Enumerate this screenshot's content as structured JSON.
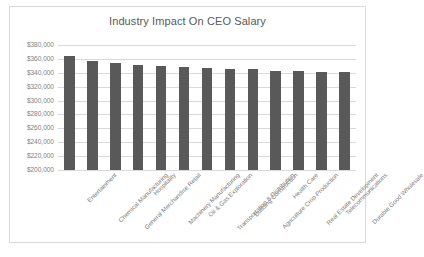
{
  "chart_data": {
    "type": "bar",
    "title": "Industry Impact On CEO Salary",
    "xlabel": "",
    "ylabel": "",
    "ylim": [
      200000,
      380000
    ],
    "ytick_step": 20000,
    "grid": true,
    "legend": false,
    "bar_color": "#595959",
    "gridline_color": "#d9d9d9",
    "ytick_labels": [
      "$380,000",
      "$360,000",
      "$340,000",
      "$320,000",
      "$300,000",
      "$280,000",
      "$260,000",
      "$240,000",
      "$220,000",
      "$200,000"
    ],
    "ytick_values": [
      380000,
      360000,
      340000,
      320000,
      300000,
      280000,
      260000,
      240000,
      220000,
      200000
    ],
    "categories": [
      "Entertainment",
      "Chemical Manufacturing",
      "General Merchandise Retail",
      "Hospitality",
      "Machinery Manufacturing",
      "Oil & Gas Exploration",
      "Transportation & Distribution",
      "Building Construction",
      "Agriculture Crop Production",
      "Health Care",
      "Real Estate Development",
      "Telecommunications",
      "Durable Good Wholesale"
    ],
    "values": [
      364000,
      357000,
      354000,
      351000,
      350000,
      348000,
      347000,
      346000,
      345000,
      343000,
      342000,
      341000,
      341000
    ]
  }
}
